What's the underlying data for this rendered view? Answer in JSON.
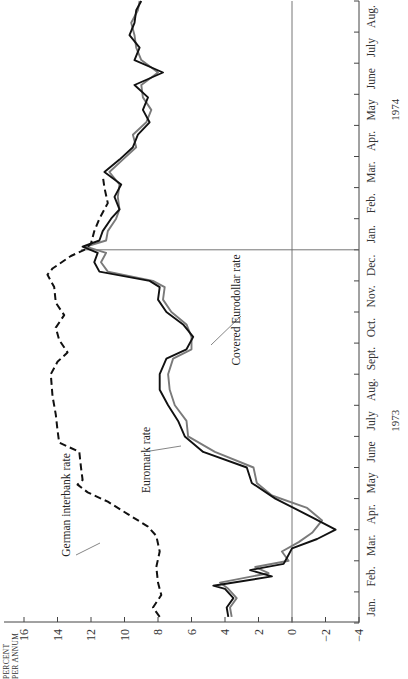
{
  "chart_data": {
    "type": "line",
    "orientation": "rotated-90-ccw",
    "title": "",
    "ylabel": "PERCENT PER ANNUM",
    "ylabel_lines": [
      "PERCENT",
      "PER ANNUM"
    ],
    "xlabel": "",
    "ylim": [
      -4,
      16
    ],
    "yticks": [
      16,
      14,
      12,
      10,
      8,
      6,
      4,
      2,
      0,
      -2,
      -4
    ],
    "ytick_labels": [
      "16",
      "14",
      "12",
      "10",
      "8",
      "6",
      "4",
      "2",
      "0",
      "−2",
      "−4"
    ],
    "x_unit": "month index (0 = start of Jan. 1973)",
    "xlim": [
      0,
      20
    ],
    "month_labels": [
      "Jan.",
      "Feb.",
      "Mar.",
      "Apr.",
      "May",
      "June",
      "July",
      "Aug.",
      "Sept.",
      "Oct.",
      "Nov.",
      "Dec.",
      "Jan.",
      "Feb.",
      "Mar.",
      "Apr.",
      "May",
      "June",
      "July",
      "Aug."
    ],
    "year_labels": [
      {
        "label": "1973",
        "at_month": 6.5
      },
      {
        "label": "1974",
        "at_month": 16.5
      }
    ],
    "reference_lines": [
      {
        "axis": "value",
        "value": 0
      },
      {
        "axis": "time",
        "value": 12
      }
    ],
    "grid": false,
    "legend": "inline annotations",
    "series": [
      {
        "name": "German interbank rate",
        "style": "dashed",
        "color": "#111111",
        "x": [
          0.2,
          0.5,
          0.9,
          1.3,
          1.8,
          2.3,
          2.8,
          3.1,
          3.5,
          3.9,
          4.2,
          4.45,
          4.6,
          5.0,
          5.5,
          5.8,
          6.2,
          6.7,
          7.3,
          8.0,
          8.4,
          8.7,
          9.1,
          9.5,
          9.9,
          10.3,
          10.8,
          11.2,
          11.4,
          11.8,
          12.0,
          12.2,
          12.6,
          13.0,
          13.5,
          14.0,
          14.4
        ],
        "values": [
          7.9,
          8.3,
          7.8,
          8.0,
          8.1,
          7.9,
          8.1,
          8.6,
          9.8,
          11.0,
          12.2,
          12.8,
          12.5,
          12.6,
          12.7,
          13.9,
          14.0,
          14.1,
          14.3,
          14.4,
          14.0,
          13.4,
          13.9,
          14.1,
          13.6,
          14.1,
          14.2,
          14.6,
          14.3,
          13.2,
          12.4,
          12.0,
          11.8,
          11.5,
          11.0,
          11.2,
          11.3
        ]
      },
      {
        "name": "Euromark rate",
        "style": "solid",
        "color": "#111111",
        "x": [
          0.2,
          0.5,
          0.8,
          1.1,
          1.2,
          1.5,
          1.7,
          1.9,
          2.1,
          2.4,
          2.7,
          3.0,
          3.4,
          4.0,
          4.5,
          5.0,
          5.5,
          6.0,
          6.5,
          7.0,
          7.5,
          8.0,
          8.5,
          8.8,
          9.2,
          9.6,
          10.0,
          10.4,
          10.8,
          11.0,
          11.3,
          11.6,
          11.9,
          12.1,
          12.3,
          12.6,
          13.0,
          13.3,
          13.7,
          14.1,
          14.5,
          14.9,
          15.3,
          15.7,
          16.1,
          16.5,
          16.9,
          17.3,
          17.7,
          18.1,
          18.5,
          18.9,
          19.3,
          19.7,
          20.0
        ],
        "values": [
          3.8,
          3.9,
          3.5,
          4.0,
          4.7,
          1.2,
          2.5,
          0.5,
          0.3,
          0.0,
          -1.5,
          -2.6,
          -1.2,
          1.0,
          2.4,
          2.7,
          5.3,
          6.4,
          6.8,
          7.4,
          7.9,
          7.9,
          7.5,
          6.3,
          5.9,
          6.5,
          7.5,
          8.0,
          7.9,
          8.5,
          11.5,
          11.8,
          11.6,
          12.5,
          11.5,
          11.3,
          10.8,
          10.3,
          10.6,
          10.2,
          11.2,
          10.3,
          9.5,
          9.2,
          8.5,
          8.9,
          8.6,
          9.4,
          7.7,
          9.4,
          9.1,
          9.7,
          9.4,
          9.3,
          9.0
        ]
      },
      {
        "name": "Covered Eurodollar rate",
        "style": "solid",
        "color": "#7a7a7a",
        "x": [
          0.2,
          0.5,
          0.8,
          1.1,
          1.3,
          1.6,
          1.8,
          2.0,
          2.3,
          2.6,
          2.9,
          3.3,
          3.7,
          4.1,
          4.5,
          5.0,
          5.5,
          6.0,
          6.5,
          7.0,
          7.5,
          8.0,
          8.5,
          8.8,
          9.2,
          9.6,
          10.0,
          10.4,
          10.8,
          11.0,
          11.3,
          11.6,
          11.9,
          12.1,
          12.3,
          12.6,
          13.0,
          13.3,
          13.7,
          14.1,
          14.5,
          14.9,
          15.3,
          15.7,
          16.1,
          16.5,
          16.9,
          17.3,
          17.7,
          18.1,
          18.5,
          18.9,
          19.3,
          19.7,
          20.0
        ],
        "values": [
          3.6,
          3.7,
          3.3,
          3.8,
          4.3,
          1.4,
          2.2,
          0.2,
          0.6,
          -0.4,
          -1.2,
          -1.8,
          -0.9,
          1.2,
          2.1,
          2.3,
          4.6,
          6.2,
          6.3,
          7.0,
          7.3,
          7.4,
          7.1,
          6.0,
          6.0,
          6.3,
          7.2,
          7.7,
          7.6,
          8.3,
          11.0,
          11.4,
          11.1,
          12.3,
          11.1,
          11.0,
          10.5,
          10.3,
          10.4,
          10.3,
          10.9,
          10.1,
          9.3,
          9.5,
          8.7,
          8.4,
          8.9,
          9.0,
          8.0,
          9.0,
          9.3,
          9.4,
          9.6,
          9.2,
          9.1
        ]
      }
    ],
    "annotations": [
      {
        "text": "German interbank rate",
        "points_to_series": "German interbank rate",
        "label_pos": [
          70,
          505
        ],
        "arrow_from": [
          76,
          555
        ],
        "arrow_to": [
          100,
          543
        ]
      },
      {
        "text": "Euromark rate",
        "points_to_series": "Euromark rate",
        "label_pos": [
          150,
          460
        ],
        "arrow_from": [
          150,
          451
        ],
        "arrow_to": [
          181,
          446
        ]
      },
      {
        "text": "Covered Eurodollar rate",
        "points_to_series": "Covered Eurodollar rate",
        "label_pos": [
          240,
          310
        ],
        "arrow_from": [
          241,
          316
        ],
        "arrow_to": [
          211,
          345
        ]
      }
    ]
  }
}
